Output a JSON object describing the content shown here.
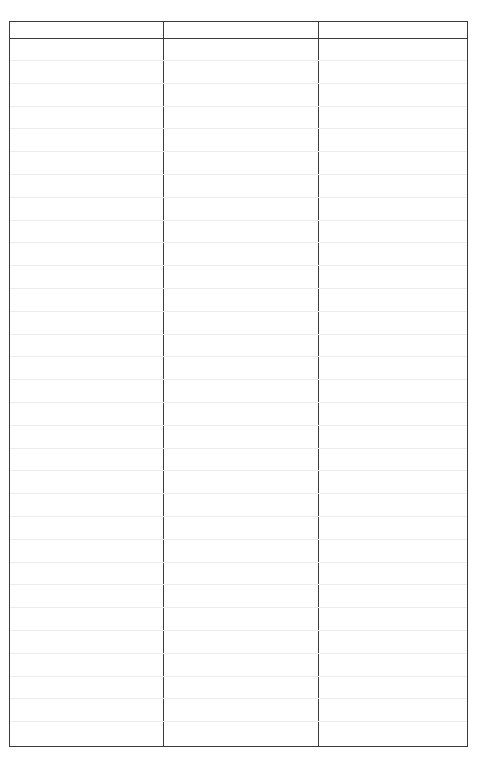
{
  "form": {
    "columns": [
      {
        "header": ""
      },
      {
        "header": ""
      },
      {
        "header": ""
      }
    ],
    "row_count": 30,
    "colors": {
      "border": "#3a3a3a",
      "rule": "#ececec",
      "background": "#ffffff"
    }
  }
}
